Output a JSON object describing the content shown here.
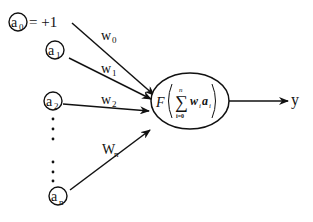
{
  "diagram": {
    "type": "perceptron",
    "inputs": [
      {
        "id": "a0",
        "base": "a",
        "sub": "0",
        "suffix": "= +1",
        "weight_base": "w",
        "weight_sub": "0"
      },
      {
        "id": "a1",
        "base": "a",
        "sub": "1",
        "suffix": "",
        "weight_base": "w",
        "weight_sub": "1"
      },
      {
        "id": "a2",
        "base": "a",
        "sub": "2",
        "suffix": "",
        "weight_base": "w",
        "weight_sub": "2"
      },
      {
        "id": "an",
        "base": "a",
        "sub": "n",
        "suffix": "",
        "weight_base": "W",
        "weight_sub": "n"
      }
    ],
    "neuron": {
      "func": "F",
      "sum_symbol": "∑",
      "sum_upper": "n",
      "sum_lower": "i=0",
      "term_w": "w",
      "term_w_sub": "i",
      "term_a": "a",
      "term_a_sub": "i"
    },
    "output": {
      "label": "y"
    }
  }
}
